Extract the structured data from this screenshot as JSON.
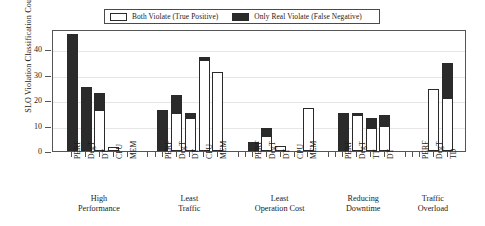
{
  "chart_data": {
    "type": "bar",
    "title": "",
    "xlabel": "",
    "ylabel": "SLO Violation Classification Count",
    "ylim": [
      0,
      48
    ],
    "yticks": [
      0,
      10,
      20,
      30,
      40
    ],
    "ytick_labels": [
      "0",
      "10",
      "20",
      "30",
      "40"
    ],
    "grid": true,
    "stacked": true,
    "legend_position": "top-center",
    "legend": [
      {
        "label": "Both Violate (True Positive)",
        "swatch": "open",
        "color": "#ffffff"
      },
      {
        "label": "Only Real Violate (False Negative)",
        "swatch": "filled",
        "color": "#2b2b2b"
      }
    ],
    "series": [
      {
        "name": "Both Violate (True Positive)",
        "style": "open"
      },
      {
        "name": "Only Real Violate (False Negative)",
        "style": "filled"
      }
    ],
    "groups": [
      {
        "name": "High Performance",
        "label_line1": "High",
        "label_line2": "Performance",
        "bars": [
          {
            "category": "PERF",
            "both_violate": 0,
            "only_real_violate": 46,
            "total": 46
          },
          {
            "category": "DegT",
            "both_violate": 0,
            "only_real_violate": 25,
            "total": 25
          },
          {
            "category": "DT",
            "both_violate": 16,
            "only_real_violate": 7,
            "total": 23
          },
          {
            "category": "CPU",
            "both_violate": 1.5,
            "only_real_violate": 0,
            "total": 1.5
          },
          {
            "category": "MEM",
            "both_violate": 0,
            "only_real_violate": 0,
            "total": 0
          }
        ]
      },
      {
        "name": "Least Traffic",
        "label_line1": "Least",
        "label_line2": "Traffic",
        "bars": [
          {
            "category": "PERF",
            "both_violate": 0,
            "only_real_violate": 16,
            "total": 16
          },
          {
            "category": "DegT",
            "both_violate": 15,
            "only_real_violate": 7,
            "total": 22
          },
          {
            "category": "DT",
            "both_violate": 13,
            "only_real_violate": 2,
            "total": 15
          },
          {
            "category": "CPU",
            "both_violate": 36,
            "only_real_violate": 1,
            "total": 37
          },
          {
            "category": "MEM",
            "both_violate": 31,
            "only_real_violate": 0,
            "total": 31
          }
        ]
      },
      {
        "name": "Least Operation Cost",
        "label_line1": "Least",
        "label_line2": "Operation Cost",
        "bars": [
          {
            "category": "PERF",
            "both_violate": 0,
            "only_real_violate": 3.5,
            "total": 3.5
          },
          {
            "category": "DegT",
            "both_violate": 6,
            "only_real_violate": 3,
            "total": 9
          },
          {
            "category": "DT",
            "both_violate": 2,
            "only_real_violate": 0,
            "total": 2
          },
          {
            "category": "CPU",
            "both_violate": 0,
            "only_real_violate": 0,
            "total": 0
          },
          {
            "category": "MEM",
            "both_violate": 17,
            "only_real_violate": 0,
            "total": 17
          }
        ]
      },
      {
        "name": "Reducing Downtime",
        "label_line1": "Reducing",
        "label_line2": "Downtime",
        "bars": [
          {
            "category": "PERF",
            "both_violate": 0,
            "only_real_violate": 15,
            "total": 15
          },
          {
            "category": "DegT",
            "both_violate": 14,
            "only_real_violate": 1,
            "total": 15
          },
          {
            "category": "TT",
            "both_violate": 9,
            "only_real_violate": 4,
            "total": 13
          },
          {
            "category": "DT",
            "both_violate": 10,
            "only_real_violate": 4,
            "total": 14
          }
        ]
      },
      {
        "name": "Traffic Overload",
        "label_line1": "Traffic",
        "label_line2": "Overload",
        "bars": [
          {
            "category": "PERF",
            "both_violate": 0,
            "only_real_violate": 0,
            "total": 0
          },
          {
            "category": "DegT",
            "both_violate": 24.5,
            "only_real_violate": 0,
            "total": 24.5
          },
          {
            "category": "TD",
            "both_violate": 21,
            "only_real_violate": 13.5,
            "total": 34.5
          }
        ]
      }
    ]
  },
  "colors": {
    "fill_open": "#ffffff",
    "fill_filled": "#2b2b2b",
    "stroke": "#2a2a2a",
    "axis": "#555555",
    "grid": "#e6e6e6",
    "background": "#ffffff"
  }
}
